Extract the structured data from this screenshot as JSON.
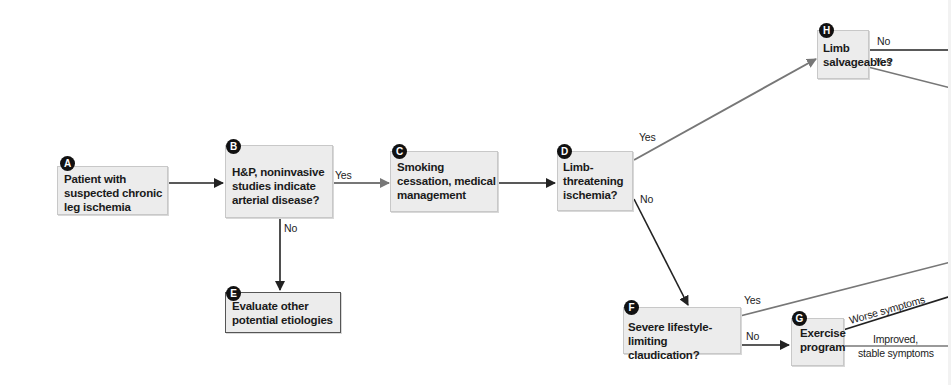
{
  "nodes": {
    "A": {
      "badge": "A",
      "lines": [
        "Patient with",
        "suspected chronic",
        "leg ischemia"
      ]
    },
    "B": {
      "badge": "B",
      "lines": [
        "H&P, noninvasive",
        "studies indicate",
        "arterial disease?"
      ]
    },
    "C": {
      "badge": "C",
      "lines": [
        "Smoking",
        "cessation, medical",
        "management"
      ]
    },
    "D": {
      "badge": "D",
      "lines": [
        "Limb-",
        "threatening",
        "ischemia?"
      ]
    },
    "E": {
      "badge": "E",
      "lines": [
        "Evaluate other",
        "potential etiologies"
      ]
    },
    "F": {
      "badge": "F",
      "lines": [
        "Severe lifestyle-limiting",
        "claudication?"
      ]
    },
    "G": {
      "badge": "G",
      "lines": [
        "Exercise",
        "program"
      ]
    },
    "H": {
      "badge": "H",
      "lines": [
        "Limb",
        "salvageable?"
      ]
    }
  },
  "edge_labels": {
    "b_yes": "Yes",
    "b_no": "No",
    "d_yes": "Yes",
    "d_no": "No",
    "f_yes": "Yes",
    "f_no": "No",
    "h_no": "No",
    "h_yes": "Yes",
    "g_worse": "Worse symptoms",
    "g_improved_1": "Improved,",
    "g_improved_2": "stable symptoms"
  },
  "colors": {
    "box_fill": "#ececec",
    "dark_arrow": "#222222",
    "gray_arrow": "#777777",
    "badge": "#111111"
  }
}
